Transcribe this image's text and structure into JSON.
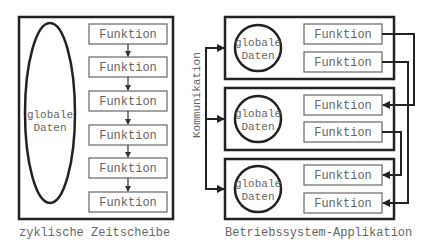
{
  "left": {
    "data_label_line1": "globale",
    "data_label_line2": "Daten",
    "functions": [
      "Funktion",
      "Funktion",
      "Funktion",
      "Funktion",
      "Funktion",
      "Funktion"
    ],
    "caption": "zyklische Zeitscheibe"
  },
  "right": {
    "apps": [
      {
        "data_label_line1": "globale",
        "data_label_line2": "Daten",
        "functions": [
          "Funktion",
          "Funktion"
        ]
      },
      {
        "data_label_line1": "globale",
        "data_label_line2": "Daten",
        "functions": [
          "Funktion",
          "Funktion"
        ]
      },
      {
        "data_label_line1": "globale",
        "data_label_line2": "Daten",
        "functions": [
          "Funktion",
          "Funktion"
        ]
      }
    ],
    "comm_label": "Kommunikation",
    "caption": "Betriebssystem-Applikation"
  }
}
